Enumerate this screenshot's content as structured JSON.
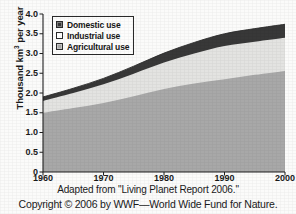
{
  "chart_data": {
    "type": "area",
    "stacked": true,
    "title": "",
    "xlabel": "",
    "ylabel": "Thousand km3 per year",
    "ylabel_parts": {
      "prefix": "Thousand km",
      "sup": "3",
      "suffix": " per year"
    },
    "x": [
      1960,
      1965,
      1970,
      1975,
      1980,
      1985,
      1990,
      1995,
      2000
    ],
    "xlim": [
      1960,
      2000
    ],
    "ylim": [
      0,
      4.0
    ],
    "xticks": [
      "1960",
      "1970",
      "1980",
      "1990",
      "2000"
    ],
    "xtick_values": [
      1960,
      1970,
      1980,
      1990,
      2000
    ],
    "yticks": [
      "0",
      "0.5",
      "1.0",
      "1.5",
      "2.0",
      "2.5",
      "3.0",
      "3.5",
      "4.0"
    ],
    "ytick_values": [
      0,
      0.5,
      1.0,
      1.5,
      2.0,
      2.5,
      3.0,
      3.5,
      4.0
    ],
    "grid": false,
    "legend_position": "top-left inside plot",
    "series": [
      {
        "name": "Agricultural use",
        "color": "#a8a8a8",
        "values": [
          1.5,
          1.62,
          1.75,
          1.92,
          2.1,
          2.24,
          2.35,
          2.46,
          2.56
        ]
      },
      {
        "name": "Industrial use",
        "color": "#e3e3e1",
        "values": [
          0.3,
          0.38,
          0.47,
          0.57,
          0.67,
          0.76,
          0.84,
          0.84,
          0.84
        ]
      },
      {
        "name": "Domestic use",
        "color": "#383838",
        "values": [
          0.1,
          0.12,
          0.15,
          0.19,
          0.24,
          0.28,
          0.31,
          0.33,
          0.34
        ]
      }
    ],
    "cumulative_tops": {
      "agricultural": [
        1.5,
        1.62,
        1.75,
        1.92,
        2.1,
        2.24,
        2.35,
        2.46,
        2.56
      ],
      "industrial": [
        1.8,
        2.0,
        2.22,
        2.49,
        2.77,
        3.0,
        3.19,
        3.3,
        3.4
      ],
      "total": [
        1.9,
        2.12,
        2.37,
        2.68,
        3.01,
        3.28,
        3.5,
        3.63,
        3.74
      ]
    }
  },
  "legend": {
    "items": [
      {
        "label": "Domestic use",
        "swatch": "domestic"
      },
      {
        "label": "Industrial use",
        "swatch": "industrial"
      },
      {
        "label": "Agricultural use",
        "swatch": "agricultural"
      }
    ]
  },
  "caption": {
    "line1": "Adapted from \"Living Planet Report 2006.\"",
    "line2": "Copyright © 2006 by WWF—World Wide Fund for Nature."
  },
  "colors": {
    "domestic": "#383838",
    "industrial": "#e3e3e1",
    "agricultural": "#a8a8a8",
    "axis": "#1f1f1f",
    "background": "#fbfbfa"
  }
}
